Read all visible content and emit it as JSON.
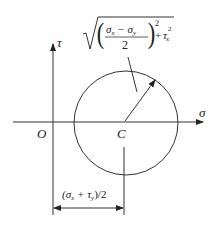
{
  "diagram": {
    "type": "mohr-circle",
    "axes": {
      "horizontal_label": "σ",
      "vertical_label": "τ",
      "origin_label": "O"
    },
    "center_label": "C",
    "radius_formula": {
      "numerator": "σx − σy",
      "sub1": "x",
      "sub2": "y",
      "denominator": "2",
      "exponent": "2",
      "plus": "+",
      "tau": "τ",
      "tau_sub": "x",
      "tau_exp": "2"
    },
    "dimension_label": {
      "open": "(σ",
      "sub1": "x",
      "mid": " + τ",
      "sub2": "y",
      "close": ")/2"
    },
    "colors": {
      "stroke": "#333333",
      "text": "#222222"
    }
  }
}
